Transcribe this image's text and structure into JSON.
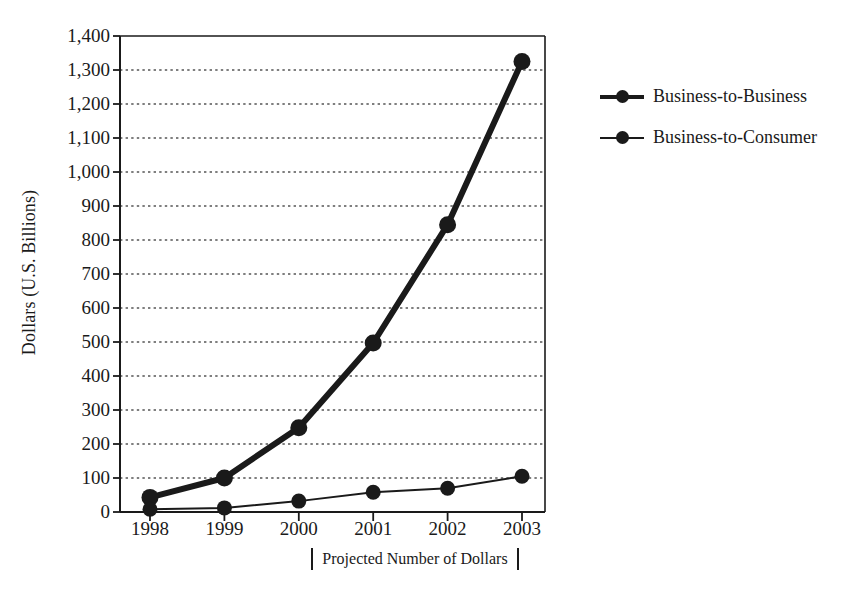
{
  "chart_data": {
    "type": "line",
    "title": "",
    "xlabel": "Projected Number of Dollars",
    "ylabel": "Dollars (U.S. Billions)",
    "categories": [
      "1998",
      "1999",
      "2000",
      "2001",
      "2002",
      "2003"
    ],
    "x": [
      1998,
      1999,
      2000,
      2001,
      2002,
      2003
    ],
    "series": [
      {
        "name": "Business-to-Business",
        "values": [
          43,
          100,
          248,
          497,
          845,
          1325
        ],
        "line_style": "thick-solid",
        "color": "#1a1a1a",
        "marker": "filled-circle"
      },
      {
        "name": "Business-to-Consumer",
        "values": [
          8,
          12,
          32,
          58,
          70,
          105
        ],
        "line_style": "thin-solid",
        "color": "#1a1a1a",
        "marker": "filled-circle"
      }
    ],
    "ylim": [
      0,
      1400
    ],
    "yticks": [
      0,
      100,
      200,
      300,
      400,
      500,
      600,
      700,
      800,
      900,
      1000,
      1100,
      1200,
      1300,
      1400
    ],
    "ytick_labels": [
      "0",
      "100",
      "200",
      "300",
      "400",
      "500",
      "600",
      "700",
      "800",
      "900",
      "1,000",
      "1,100",
      "1,200",
      "1,300",
      "1,400"
    ],
    "xtick_labels": [
      "1998",
      "1999",
      "2000",
      "2001",
      "2002",
      "2003"
    ],
    "grid": "horizontal-dotted",
    "legend_position": "right"
  },
  "legend": {
    "items": [
      {
        "label": "Business-to-Business",
        "style": "thick"
      },
      {
        "label": "Business-to-Consumer",
        "style": "thin"
      }
    ]
  },
  "axes": {
    "y_title": "Dollars (U.S. Billions)",
    "x_caption": "Projected Number of Dollars"
  },
  "colors": {
    "ink": "#1a1a1a",
    "grid": "#555555",
    "background": "#ffffff"
  }
}
